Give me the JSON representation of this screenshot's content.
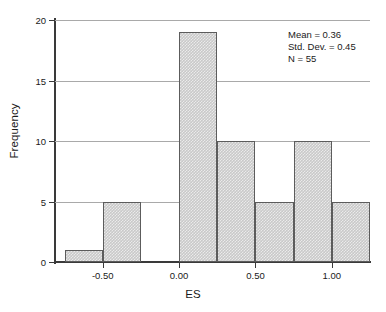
{
  "chart_data": {
    "type": "bar",
    "title": "",
    "xlabel": "ES",
    "ylabel": "Frequency",
    "categories": [
      "-0.75 to -0.50",
      "-0.50 to -0.25",
      "-0.25 to 0.00",
      "0.00 to 0.25",
      "0.25 to 0.50",
      "0.50 to 0.75",
      "0.75 to 1.00",
      "1.00 to 1.25"
    ],
    "bin_edges": [
      -0.75,
      -0.5,
      -0.25,
      0.0,
      0.25,
      0.5,
      0.75,
      1.0,
      1.25
    ],
    "bin_width": 0.25,
    "values": [
      1,
      5,
      0,
      19,
      10,
      5,
      10,
      5
    ],
    "xlim": [
      -0.8125,
      1.25
    ],
    "ylim": [
      0,
      20
    ],
    "xticks": [
      -0.5,
      0.0,
      0.5,
      1.0
    ],
    "xticklabels": [
      "-0.50",
      "0.00",
      "0.50",
      "1.00"
    ],
    "yticks": [
      0,
      5,
      10,
      15,
      20
    ],
    "yticklabels": [
      "0",
      "5",
      "10",
      "15",
      "20"
    ],
    "grid": "horizontal",
    "legend": "none",
    "bar_fill_color": "#c9c9c9",
    "bar_edge_color": "#5c5c5c",
    "gridline_color": "#a9a9a9",
    "axis_color": "#3a3a3a",
    "annotations": {
      "mean_label": "Mean = 0.36",
      "stddev_label": "Std. Dev. = 0.45",
      "n_label": "N = 55",
      "mean": 0.36,
      "std_dev": 0.45,
      "n": 55
    }
  }
}
